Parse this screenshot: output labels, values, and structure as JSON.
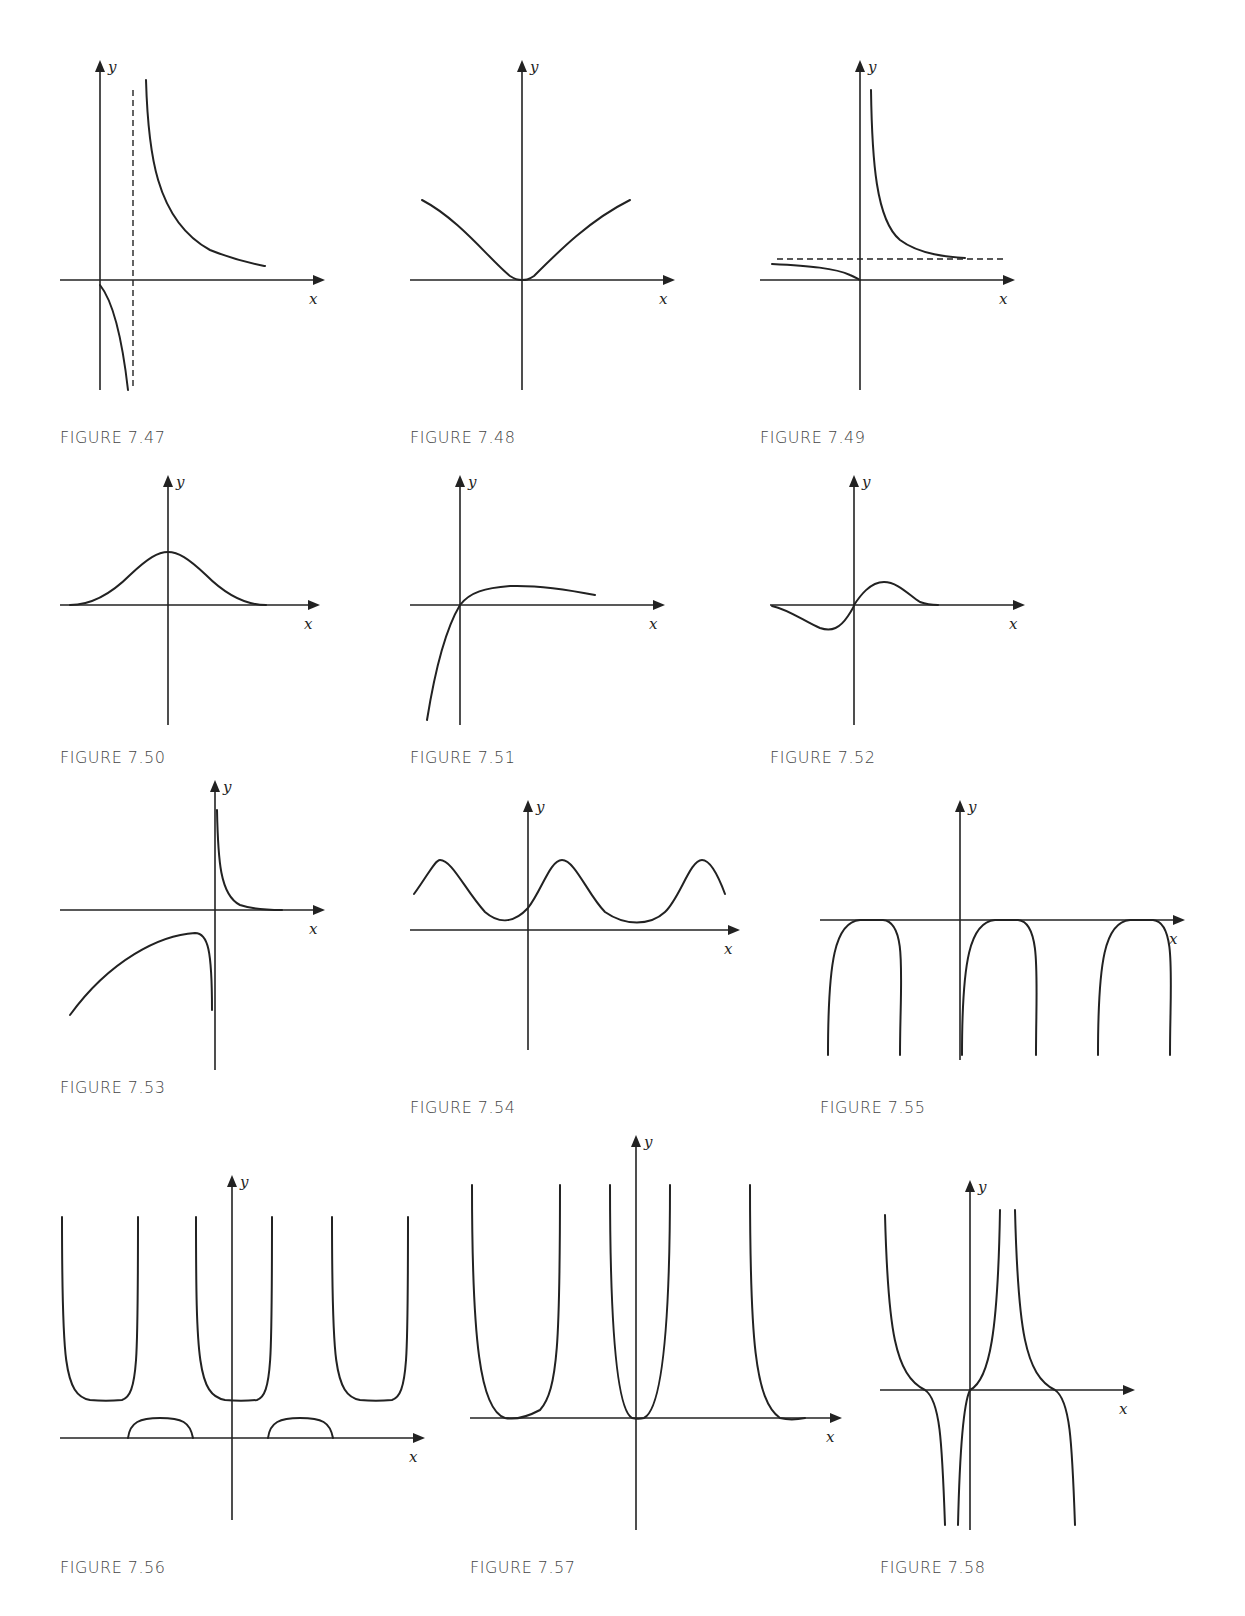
{
  "figures": [
    {
      "id": "7.47",
      "caption": "FIGURE 7.47",
      "box": [
        60,
        60,
        270,
        370
      ],
      "origin": [
        40,
        220
      ],
      "xaxis": [
        0,
        255
      ],
      "yaxis": [
        10,
        330
      ],
      "xlabel": "x",
      "ylabel": "y",
      "curves": [
        "M40,225 C48,235 60,260 68,330",
        "M86,20 C88,90 95,160 150,190 C180,202 200,205 205,206"
      ],
      "dashes": [
        "M73,30 L73,330"
      ]
    },
    {
      "id": "7.48",
      "caption": "FIGURE 7.48",
      "box": [
        410,
        60,
        280,
        370
      ],
      "origin": [
        112,
        220
      ],
      "xaxis": [
        0,
        255
      ],
      "yaxis": [
        10,
        330
      ],
      "xlabel": "x",
      "ylabel": "y",
      "curves": [
        "M12,140 C50,160 80,200 100,216 C106,220 110,220 112,220 C116,220 118,220 124,216 C150,190 180,160 220,140"
      ],
      "dashes": []
    },
    {
      "id": "7.49",
      "caption": "FIGURE 7.49",
      "box": [
        760,
        60,
        270,
        370
      ],
      "origin": [
        100,
        220
      ],
      "xaxis": [
        0,
        245
      ],
      "yaxis": [
        10,
        330
      ],
      "xlabel": "x",
      "ylabel": "y",
      "curves": [
        "M12,204 C50,206 75,208 90,215 C95,217 98,219 100,220",
        "M111,30 C112,100 116,160 140,180 C160,195 190,197 205,198"
      ],
      "dashes": [
        "M17,199 L245,199"
      ]
    },
    {
      "id": "7.50",
      "caption": "FIGURE 7.50",
      "box": [
        60,
        470,
        260,
        280
      ],
      "origin": [
        108,
        135
      ],
      "xaxis": [
        0,
        250
      ],
      "yaxis": [
        15,
        255
      ],
      "xlabel": "x",
      "ylabel": "y",
      "curves": [
        "M10,135 C30,135 50,125 70,105 C88,88 98,82 108,82 C118,82 128,88 146,105 C166,125 186,135 206,135"
      ],
      "dashes": []
    },
    {
      "id": "7.51",
      "caption": "FIGURE 7.51",
      "box": [
        410,
        470,
        250,
        280
      ],
      "origin": [
        50,
        135
      ],
      "xaxis": [
        0,
        245
      ],
      "yaxis": [
        15,
        255
      ],
      "xlabel": "x",
      "ylabel": "y",
      "curves": [
        "M17,250 C25,200 35,160 50,135 C60,122 75,118 100,116 C130,115 160,120 185,125"
      ],
      "dashes": []
    },
    {
      "id": "7.52",
      "caption": "FIGURE 7.52",
      "box": [
        770,
        470,
        260,
        280
      ],
      "origin": [
        84,
        135
      ],
      "xaxis": [
        0,
        245
      ],
      "yaxis": [
        15,
        255
      ],
      "xlabel": "x",
      "ylabel": "y",
      "curves": [
        "M2,136 C20,140 35,152 50,158 C62,162 70,158 78,146 C82,140 84,136 84,135 C90,126 100,112 114,112 C128,112 140,126 150,132 C158,135 164,135 168,135"
      ],
      "dashes": []
    },
    {
      "id": "7.53",
      "caption": "FIGURE 7.53",
      "box": [
        60,
        780,
        260,
        300
      ],
      "origin": [
        155,
        130
      ],
      "xaxis": [
        0,
        255
      ],
      "yaxis": [
        10,
        290
      ],
      "xlabel": "x",
      "ylabel": "y",
      "curves": [
        "M157,30 C158,80 160,115 180,125 C195,130 210,130 222,130",
        "M10,235 C50,180 100,155 135,153 C148,153 152,170 152,230"
      ],
      "dashes": []
    },
    {
      "id": "7.54",
      "caption": "FIGURE 7.54",
      "box": [
        410,
        800,
        320,
        300
      ],
      "origin": [
        118,
        130
      ],
      "xaxis": [
        0,
        320
      ],
      "yaxis": [
        10,
        250
      ],
      "xlabel": "x",
      "ylabel": "y",
      "curves": [
        "M4,94 C18,75 25,60 30,60 C42,60 55,90 75,112 C90,125 105,122 118,108 C132,90 140,60 152,60 C165,60 178,95 195,112 C215,126 240,126 255,112 C270,98 280,60 292,60 C300,60 308,75 315,94"
      ],
      "dashes": []
    },
    {
      "id": "7.55",
      "caption": "FIGURE 7.55",
      "box": [
        820,
        800,
        370,
        300
      ],
      "origin": [
        140,
        120
      ],
      "xaxis": [
        0,
        355
      ],
      "yaxis": [
        10,
        260
      ],
      "xlabel": "x",
      "ylabel": "y",
      "curves": [
        "M8,255 C8,160 15,122 40,120 C52,120 55,120 63,120 C88,122 80,180 80,255",
        "M142,255 C142,160 150,122 175,120 C187,120 190,120 198,120 C222,122 216,180 216,255",
        "M278,255 C278,160 285,122 310,120 C322,120 325,120 333,120 C357,122 350,180 350,255"
      ],
      "dashes": []
    },
    {
      "id": "7.56",
      "caption": "FIGURE 7.56",
      "box": [
        60,
        1160,
        360,
        400
      ],
      "origin": [
        172,
        278
      ],
      "xaxis": [
        0,
        355
      ],
      "yaxis": [
        25,
        360
      ],
      "xlabel": "x",
      "ylabel": "y",
      "curves": [
        "M2,57 C2,200 4,235 30,240 C40,241 52,241 62,240 C78,235 78,200 78,57",
        "M136,57 C136,200 138,235 165,240 C175,241 187,241 197,240 C212,235 212,200 212,57",
        "M272,57 C272,200 274,235 300,240 C310,241 322,241 332,240 C348,235 348,200 348,57",
        "M68,278 C70,262 80,258 100,258 C122,258 130,262 133,278",
        "M208,278 C210,262 220,258 240,258 C262,258 270,262 273,278"
      ],
      "dashes": []
    },
    {
      "id": "7.57",
      "caption": "FIGURE 7.57",
      "box": [
        470,
        1140,
        370,
        420
      ],
      "origin": [
        166,
        278
      ],
      "xaxis": [
        0,
        362
      ],
      "yaxis": [
        5,
        390
      ],
      "xlabel": "x",
      "ylabel": "y",
      "curves": [
        "M2,45 C2,200 10,270 35,278 C45,280 55,278 70,270 C88,250 90,200 90,45",
        "M140,45 C140,200 148,270 162,278 C166,279 170,279 174,278 C190,270 200,200 200,45",
        "M280,45 C280,200 285,260 310,278 C318,280 325,280 335,278"
      ],
      "dashes": []
    },
    {
      "id": "7.58",
      "caption": "FIGURE 7.58",
      "box": [
        880,
        1180,
        260,
        380
      ],
      "origin": [
        90,
        210
      ],
      "xaxis": [
        0,
        245
      ],
      "yaxis": [
        10,
        350
      ],
      "xlabel": "x",
      "ylabel": "y",
      "curves": [
        "M5,35 C8,150 15,195 45,210 C60,220 62,260 65,345",
        "M78,345 C80,260 85,220 90,210 C110,200 118,150 120,30",
        "M135,30 C138,150 145,195 175,210 C190,220 192,260 195,345"
      ],
      "dashes": []
    }
  ]
}
